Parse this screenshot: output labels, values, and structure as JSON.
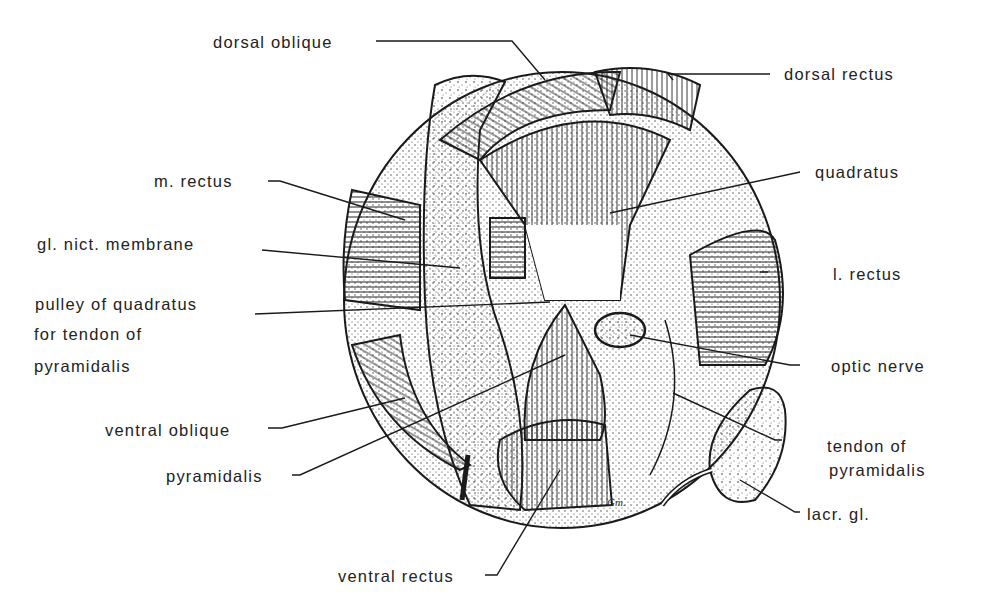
{
  "figure": {
    "signature": "Gm.",
    "labels": {
      "dorsal_oblique": "dorsal oblique",
      "dorsal_rectus": "dorsal rectus",
      "m_rectus": "m. rectus",
      "quadratus": "quadratus",
      "gl_nict_membrane": "gl. nict. membrane",
      "l_rectus": "l. rectus",
      "pulley_line1": "pulley of quadratus",
      "pulley_line2": "for tendon of",
      "pulley_line3": "pyramidalis",
      "optic_nerve": "optic nerve",
      "ventral_oblique": "ventral oblique",
      "tendon_line1": "tendon of",
      "tendon_line2": "pyramidalis",
      "pyramidalis": "pyramidalis",
      "lacr_gl": "lacr. gl.",
      "ventral_rectus": "ventral rectus"
    }
  }
}
